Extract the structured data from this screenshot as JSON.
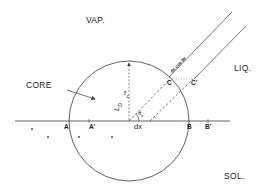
{
  "phases": {
    "vapor": "VAP.",
    "liquid": "LIQ.",
    "solid": "SOL."
  },
  "labels": {
    "core": "CORE",
    "core_radius": "r",
    "core_radius_sub": "c",
    "dislocation_line": "L",
    "dislocation_sub": "D",
    "angle": "θ",
    "angle_sub": "e",
    "displacement": "dx",
    "film_width": "dx cos θe"
  },
  "points": {
    "A": "A",
    "A_prime": "A'",
    "B": "B",
    "B_prime": "B'",
    "C": "C",
    "C_prime": "C'"
  },
  "colors": {
    "line": "#3a3a3a",
    "text": "#1a1a1a",
    "background": "#ffffff"
  }
}
